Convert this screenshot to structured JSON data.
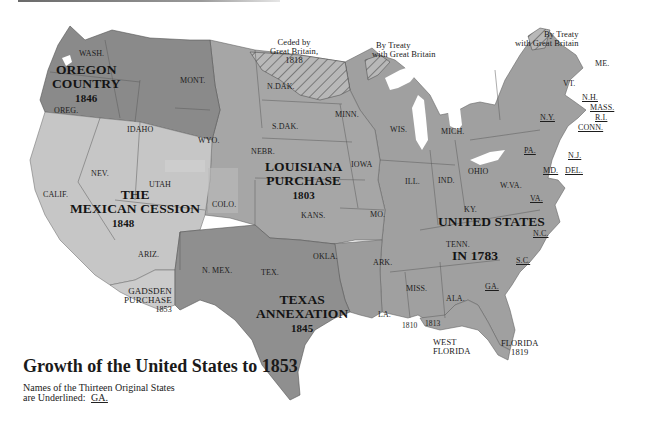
{
  "map": {
    "title": "Growth of the United States to 1853",
    "legend": {
      "line1": "Names of the Thirteen Original States",
      "line2": "are Underlined:",
      "example": "GA."
    },
    "regions": [
      {
        "name": "OREGON COUNTRY",
        "line1": "OREGON",
        "line2": "COUNTRY",
        "year": "1846",
        "fill": "#8a8a8a"
      },
      {
        "name": "LOUISIANA PURCHASE",
        "line1": "LOUISIANA",
        "line2": "PURCHASE",
        "year": "1803",
        "fill": "#a4a4a4"
      },
      {
        "name": "THE MEXICAN CESSION",
        "line1": "THE",
        "line2": "MEXICAN CESSION",
        "year": "1848",
        "fill": "#c4c4c4"
      },
      {
        "name": "TEXAS ANNEXATION",
        "line1": "TEXAS",
        "line2": "ANNEXATION",
        "year": "1845",
        "fill": "#8e8e8e"
      },
      {
        "name": "UNITED STATES IN 1783",
        "line1": "UNITED STATES",
        "line2": "IN 1783",
        "fill": "#9e9e9e"
      },
      {
        "name": "GADSDEN PURCHASE",
        "line1": "GADSDEN",
        "line2": "PURCHASE",
        "year": "1853",
        "fill": "#cacaca"
      },
      {
        "name": "FLORIDA",
        "line1": "FLORIDA",
        "year": "1819"
      },
      {
        "name": "WEST FLORIDA",
        "line1": "WEST",
        "line2": "FLORIDA",
        "year_a": "1810",
        "year_b": "1813"
      }
    ],
    "annotations": {
      "ceded": {
        "line1": "Ceded by",
        "line2": "Great Britain,",
        "line3": "1818"
      },
      "treaty_mid": {
        "line1": "By Treaty",
        "line2": "with Great Britain"
      },
      "treaty_ne": {
        "line1": "By Treaty",
        "line2": "with Great Britain"
      }
    },
    "states": {
      "wash": "WASH.",
      "oreg": "OREG.",
      "idaho": "IDAHO",
      "mont": "MONT.",
      "wyo": "WYO.",
      "calif": "CALIF.",
      "nev": "NEV.",
      "utah": "UTAH",
      "ariz": "ARIZ.",
      "colo": "COLO.",
      "nmex": "N. MEX.",
      "ndak": "N.DAK.",
      "sdak": "S.DAK.",
      "nebr": "NEBR.",
      "kans": "KANS.",
      "okla": "OKLA.",
      "tex": "TEX.",
      "minn": "MINN.",
      "iowa": "IOWA",
      "mo": "MO.",
      "ark": "ARK.",
      "la": "LA.",
      "wis": "WIS.",
      "mich": "MICH.",
      "ill": "ILL.",
      "ind": "IND.",
      "ohio": "OHIO",
      "ky": "KY.",
      "tenn": "TENN.",
      "miss": "MISS.",
      "ala": "ALA.",
      "wva": "W.VA.",
      "vt": "VT.",
      "me": "ME.",
      "ga": "GA.",
      "sc": "S.C.",
      "nc": "N.C.",
      "va": "VA.",
      "md": "MD.",
      "del": "DEL.",
      "nj": "N.J.",
      "pa": "PA.",
      "ny": "N.Y.",
      "conn": "CONN.",
      "ri": "R.I.",
      "mass": "MASS.",
      "nh": "N.H."
    },
    "original_states": [
      "GA.",
      "S.C.",
      "N.C.",
      "VA.",
      "MD.",
      "DEL.",
      "N.J.",
      "PA.",
      "N.Y.",
      "CONN.",
      "R.I.",
      "MASS.",
      "N.H."
    ]
  }
}
